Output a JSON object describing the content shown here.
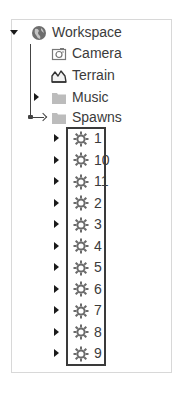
{
  "explorer": {
    "root": {
      "label": "Workspace",
      "icon": "workspace-globe-icon",
      "expanded": true,
      "children": [
        {
          "label": "Camera",
          "icon": "camera-icon",
          "has_children": false
        },
        {
          "label": "Terrain",
          "icon": "terrain-icon",
          "has_children": false
        },
        {
          "label": "Music",
          "icon": "folder-icon",
          "has_children": true,
          "expanded": false
        },
        {
          "label": "Spawns",
          "icon": "folder-icon",
          "has_children": true,
          "expanded": true
        }
      ]
    },
    "spawns_children": [
      {
        "label": "1",
        "icon": "spawn-location-icon"
      },
      {
        "label": "10",
        "icon": "spawn-location-icon"
      },
      {
        "label": "11",
        "icon": "spawn-location-icon"
      },
      {
        "label": "2",
        "icon": "spawn-location-icon"
      },
      {
        "label": "3",
        "icon": "spawn-location-icon"
      },
      {
        "label": "4",
        "icon": "spawn-location-icon"
      },
      {
        "label": "5",
        "icon": "spawn-location-icon"
      },
      {
        "label": "6",
        "icon": "spawn-location-icon"
      },
      {
        "label": "7",
        "icon": "spawn-location-icon"
      },
      {
        "label": "8",
        "icon": "spawn-location-icon"
      },
      {
        "label": "9",
        "icon": "spawn-location-icon"
      }
    ]
  },
  "colors": {
    "text": "#3b3b3b",
    "folder": "#b8b8b8",
    "icon_gray": "#707070",
    "frame_border": "#d8d8d8",
    "highlight_border": "#3a3a3a"
  }
}
